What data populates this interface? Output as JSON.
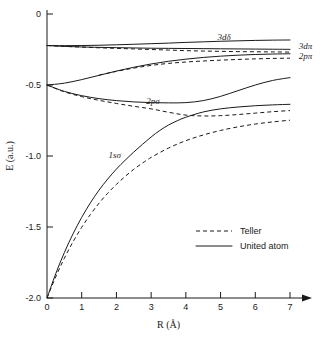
{
  "chart_data": {
    "type": "line",
    "title": "",
    "subtitle": "",
    "xlabel": "R (Å)",
    "ylabel": "E (a.u.)",
    "xlim": [
      0,
      7
    ],
    "ylim": [
      -2.0,
      0.0
    ],
    "grid": false,
    "xticks": [
      "0",
      "1",
      "2",
      "3",
      "4",
      "5",
      "6",
      "7"
    ],
    "xtick_values": [
      0,
      1,
      2,
      3,
      4,
      5,
      6,
      7
    ],
    "yticks": [
      "0",
      "-0.5",
      "-1.0",
      "-1.5",
      "-2.0"
    ],
    "ytick_values": [
      0,
      -0.5,
      -1.0,
      -1.5,
      -2.0
    ],
    "x_axis_arrow": true,
    "legend_position": "lower-right",
    "legend": [
      {
        "label": "Teller",
        "style": "dashed"
      },
      {
        "label": "United atom",
        "style": "solid"
      }
    ],
    "annotations": [
      {
        "text": "3dδ",
        "x": 5.1,
        "y": -0.185
      },
      {
        "text": "3dπ",
        "x": 7.25,
        "y": -0.245
      },
      {
        "text": "2pπ",
        "x": 7.25,
        "y": -0.315
      },
      {
        "text": "2pσ",
        "x": 3.05,
        "y": -0.632
      },
      {
        "text": "1sσ",
        "x": 1.95,
        "y": -1.015
      }
    ],
    "series": [
      {
        "name": "3dδ united atom",
        "style": "solid",
        "x": [
          0,
          0.5,
          1.0,
          1.5,
          2.0,
          2.5,
          3.0,
          3.5,
          4.0,
          4.5,
          5.0,
          5.5,
          6.0,
          6.5,
          7.0
        ],
        "y": [
          -0.222,
          -0.223,
          -0.222,
          -0.22,
          -0.217,
          -0.213,
          -0.209,
          -0.205,
          -0.2,
          -0.196,
          -0.192,
          -0.189,
          -0.186,
          -0.184,
          -0.183
        ]
      },
      {
        "name": "3dπ united atom",
        "style": "solid",
        "x": [
          0,
          0.5,
          1.0,
          1.5,
          2.0,
          2.5,
          3.0,
          3.5,
          4.0,
          4.5,
          5.0,
          5.5,
          6.0,
          6.5,
          7.0
        ],
        "y": [
          -0.222,
          -0.228,
          -0.232,
          -0.235,
          -0.237,
          -0.239,
          -0.241,
          -0.242,
          -0.243,
          -0.244,
          -0.245,
          -0.246,
          -0.247,
          -0.248,
          -0.249
        ]
      },
      {
        "name": "3dπ Teller",
        "style": "dashed",
        "x": [
          0,
          0.5,
          1.0,
          1.5,
          2.0,
          2.5,
          3.0,
          3.5,
          4.0,
          4.5,
          5.0,
          5.5,
          6.0,
          6.5,
          7.0
        ],
        "y": [
          -0.222,
          -0.228,
          -0.233,
          -0.238,
          -0.242,
          -0.246,
          -0.25,
          -0.254,
          -0.258,
          -0.261,
          -0.263,
          -0.265,
          -0.266,
          -0.267,
          -0.268
        ]
      },
      {
        "name": "2pπ united atom",
        "style": "solid",
        "x": [
          0,
          0.5,
          1.0,
          1.5,
          2.0,
          2.5,
          3.0,
          3.5,
          4.0,
          4.5,
          5.0,
          5.5,
          6.0,
          6.5,
          7.0
        ],
        "y": [
          -0.5,
          -0.487,
          -0.462,
          -0.432,
          -0.402,
          -0.375,
          -0.352,
          -0.333,
          -0.318,
          -0.306,
          -0.297,
          -0.29,
          -0.285,
          -0.282,
          -0.28
        ]
      },
      {
        "name": "2pπ Teller",
        "style": "dashed",
        "x": [
          1.5,
          2.0,
          2.5,
          3.0,
          3.5,
          4.0,
          4.5,
          5.0,
          5.5,
          6.0,
          6.5,
          7.0
        ],
        "y": [
          -0.43,
          -0.404,
          -0.381,
          -0.362,
          -0.348,
          -0.338,
          -0.331,
          -0.325,
          -0.32,
          -0.316,
          -0.313,
          -0.311
        ]
      },
      {
        "name": "2pσ united atom",
        "style": "solid",
        "x": [
          0,
          0.5,
          1.0,
          1.5,
          2.0,
          2.5,
          3.0,
          3.5,
          4.0,
          4.5,
          5.0,
          5.5,
          6.0,
          6.5,
          7.0
        ],
        "y": [
          -0.5,
          -0.545,
          -0.575,
          -0.596,
          -0.61,
          -0.619,
          -0.624,
          -0.626,
          -0.624,
          -0.61,
          -0.58,
          -0.54,
          -0.5,
          -0.468,
          -0.448
        ]
      },
      {
        "name": "2pσ Teller",
        "style": "dashed",
        "x": [
          0,
          0.5,
          1.0,
          1.5,
          2.0,
          2.5,
          3.0,
          3.5,
          4.0,
          4.5,
          5.0,
          5.5,
          6.0,
          6.5,
          7.0
        ],
        "y": [
          -0.5,
          -0.548,
          -0.582,
          -0.608,
          -0.63,
          -0.65,
          -0.668,
          -0.692,
          -0.712,
          -0.718,
          -0.716,
          -0.708,
          -0.698,
          -0.688,
          -0.68
        ]
      },
      {
        "name": "1sσ united atom",
        "style": "solid",
        "x": [
          0,
          0.25,
          0.5,
          0.75,
          1.0,
          1.25,
          1.5,
          1.75,
          2.0,
          2.25,
          2.5,
          2.75,
          3.0,
          3.25,
          3.5,
          3.75,
          4.0,
          4.5,
          5.0,
          5.5,
          6.0,
          6.5,
          7.0
        ],
        "y": [
          -2.0,
          -1.83,
          -1.68,
          -1.548,
          -1.432,
          -1.33,
          -1.24,
          -1.162,
          -1.092,
          -1.03,
          -0.972,
          -0.918,
          -0.866,
          -0.82,
          -0.782,
          -0.752,
          -0.727,
          -0.69,
          -0.668,
          -0.655,
          -0.646,
          -0.64,
          -0.636
        ]
      },
      {
        "name": "1sσ Teller",
        "style": "dashed",
        "x": [
          0,
          0.25,
          0.5,
          0.75,
          1.0,
          1.25,
          1.5,
          1.75,
          2.0,
          2.25,
          2.5,
          2.75,
          3.0,
          3.5,
          4.0,
          4.5,
          5.0,
          5.5,
          6.0,
          6.5,
          7.0
        ],
        "y": [
          -2.0,
          -1.852,
          -1.72,
          -1.604,
          -1.502,
          -1.412,
          -1.332,
          -1.262,
          -1.2,
          -1.144,
          -1.094,
          -1.05,
          -1.01,
          -0.944,
          -0.892,
          -0.852,
          -0.82,
          -0.795,
          -0.775,
          -0.76,
          -0.748
        ]
      }
    ]
  }
}
